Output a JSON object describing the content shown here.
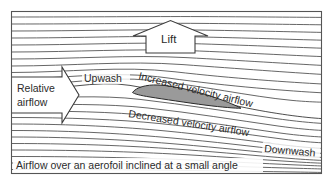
{
  "figure": {
    "caption": "Airflow over an aerofoil inclined at a small angle",
    "labels": {
      "lift": "Lift",
      "relative_airflow_line1": "Relative",
      "relative_airflow_line2": "airflow",
      "upwash": "Upwash",
      "increased_velocity": "Increased velocity airflow",
      "decreased_velocity": "Decreased velocity airflow",
      "downwash": "Downwash"
    },
    "colors": {
      "aerofoil_fill": "#9a9a9a",
      "aerofoil_stroke": "#2a2a2a",
      "streamline": "#4a4a4a",
      "frame": "#555555",
      "arrow_fill": "#ffffff",
      "arrow_stroke": "#3c3c3c",
      "text": "#2b2b2b",
      "background": "#ffffff"
    },
    "icons": {
      "lift_arrow": "arrow-up-icon",
      "relative_airflow_arrow": "arrow-right-icon"
    }
  }
}
